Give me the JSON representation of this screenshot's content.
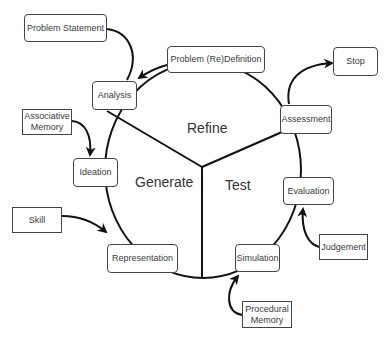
{
  "diagram": {
    "type": "cycle",
    "regions": {
      "refine": "Refine",
      "generate": "Generate",
      "test": "Test"
    },
    "process_nodes": {
      "analysis": "Analysis",
      "ideation": "Ideation",
      "representation": "Representation",
      "simulation": "Simulation",
      "evaluation": "Evaluation",
      "assessment": "Assessment",
      "problem_redefinition": "Problem (Re)Definition"
    },
    "external_nodes": {
      "problem_statement": "Problem Statement",
      "stop": "Stop",
      "associative_memory": "Associative Memory",
      "skill": "Skill",
      "judgement": "Judgement",
      "procedural_memory": "Procedural Memory"
    },
    "edges": [
      {
        "from": "Problem Statement",
        "to": "Analysis"
      },
      {
        "from": "Problem (Re)Definition",
        "to": "Analysis"
      },
      {
        "from": "Assessment",
        "to": "Stop"
      },
      {
        "from": "Associative Memory",
        "to": "Ideation"
      },
      {
        "from": "Skill",
        "to": "Representation"
      },
      {
        "from": "Judgement",
        "to": "Evaluation"
      },
      {
        "from": "Procedural Memory",
        "to": "Simulation"
      }
    ],
    "colors": {
      "stroke": "#111111",
      "box_border": "#444444",
      "text": "#333333",
      "background": "#ffffff"
    }
  }
}
